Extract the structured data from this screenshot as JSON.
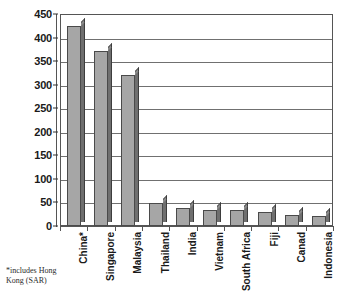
{
  "chart_data": {
    "type": "bar",
    "title": "",
    "subtitle": "",
    "xlabel": "",
    "ylabel": "",
    "ylim": [
      0,
      450
    ],
    "ytick_step": 50,
    "yticks": [
      450,
      400,
      350,
      300,
      250,
      200,
      150,
      100,
      50,
      0
    ],
    "grid": true,
    "legend": false,
    "legend_position": "none",
    "bar_style": "3d-shaded-gray",
    "categories": [
      "China*",
      "Singapore",
      "Malaysia",
      "Thailand",
      "India",
      "Vietnam",
      "South Africa",
      "Fiji",
      "Canad",
      "Indonesia"
    ],
    "values": [
      424,
      371,
      321,
      48,
      38,
      33,
      33,
      29,
      24,
      22
    ],
    "annotations": [
      "*includes Hong Kong (SAR)"
    ]
  },
  "axis": {
    "y_tick_labels": [
      "450",
      "400",
      "350",
      "300",
      "250",
      "200",
      "150",
      "100",
      "50",
      "0"
    ]
  },
  "footnote": {
    "line1": "*includes Hong",
    "line2": "Kong (SAR)"
  },
  "colors": {
    "bar_face": "#a6a6a6",
    "bar_side": "#6f6f6f",
    "bar_top": "#8a8a8a",
    "bar_outline": "#4a4a4a",
    "gridline": "#707070",
    "frame": "#555555",
    "text": "#1a1a1a",
    "background": "#ffffff"
  }
}
